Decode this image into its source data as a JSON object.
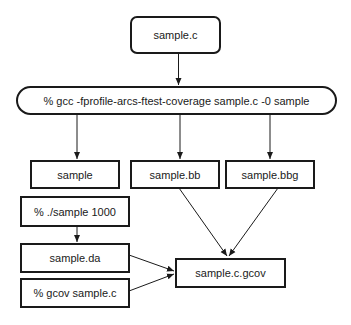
{
  "diagram": {
    "title": "",
    "nodes": [
      {
        "id": "source",
        "label": "sample.c",
        "shape": "rounded-rect"
      },
      {
        "id": "compile",
        "label": "% gcc -fprofile-arcs-ftest-coverage sample.c -0 sample",
        "shape": "pill"
      },
      {
        "id": "binary",
        "label": "sample",
        "shape": "rect"
      },
      {
        "id": "bb",
        "label": "sample.bb",
        "shape": "rect"
      },
      {
        "id": "bbg",
        "label": "sample.bbg",
        "shape": "rect"
      },
      {
        "id": "run",
        "label": "% ./sample 1000",
        "shape": "rect"
      },
      {
        "id": "da",
        "label": "sample.da",
        "shape": "rect"
      },
      {
        "id": "gcov_cmd",
        "label": "% gcov sample.c",
        "shape": "rect"
      },
      {
        "id": "gcov_out",
        "label": "sample.c.gcov",
        "shape": "rect"
      }
    ],
    "edges": [
      {
        "from": "source",
        "to": "compile"
      },
      {
        "from": "compile",
        "to": "binary"
      },
      {
        "from": "compile",
        "to": "bb"
      },
      {
        "from": "compile",
        "to": "bbg"
      },
      {
        "from": "run",
        "to": "da"
      },
      {
        "from": "bb",
        "to": "gcov_out"
      },
      {
        "from": "bbg",
        "to": "gcov_out"
      },
      {
        "from": "da",
        "to": "gcov_out"
      },
      {
        "from": "gcov_cmd",
        "to": "gcov_out"
      }
    ],
    "colors": {
      "stroke": "#1a1a1a",
      "background": "#ffffff",
      "text": "#1a1a1a"
    }
  }
}
